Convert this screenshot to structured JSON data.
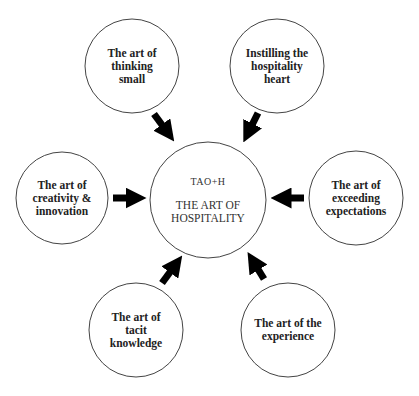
{
  "diagram": {
    "center": {
      "abbr": "TAO+H",
      "label_line1": "THE ART OF",
      "label_line2": "HOSPITALITY"
    },
    "nodes": [
      {
        "id": "thinking-small",
        "lines": [
          "The art of",
          "thinking",
          "small"
        ]
      },
      {
        "id": "hospitality-heart",
        "lines": [
          "Instilling the",
          "hospitality",
          "heart"
        ]
      },
      {
        "id": "creativity-innovation",
        "lines": [
          "The art of",
          "creativity &",
          "innovation"
        ]
      },
      {
        "id": "exceeding-expectations",
        "lines": [
          "The art of",
          "exceeding",
          "expectations"
        ]
      },
      {
        "id": "tacit-knowledge",
        "lines": [
          "The art of",
          "tacit",
          "knowledge"
        ]
      },
      {
        "id": "the-experience",
        "lines": [
          "The art of the",
          "experience"
        ]
      }
    ],
    "colors": {
      "stroke": "#333333",
      "arrow": "#000000",
      "text": "#222222"
    }
  }
}
